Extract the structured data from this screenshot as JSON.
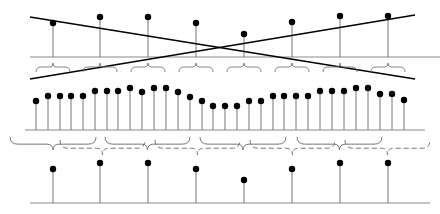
{
  "diagram": {
    "title": "",
    "colors": {
      "stroke": "#000000",
      "stem": "#777777",
      "baseline": "#888888",
      "brace": "#777777",
      "dot": "#000000",
      "background": "#ffffff"
    },
    "top_row": {
      "baseline_y": 57,
      "x_start": 30,
      "x_end": 440,
      "stems": [
        {
          "x": 53,
          "y": 23
        },
        {
          "x": 100,
          "y": 17
        },
        {
          "x": 148,
          "y": 17
        },
        {
          "x": 196,
          "y": 23
        },
        {
          "x": 244,
          "y": 34
        },
        {
          "x": 292,
          "y": 22
        },
        {
          "x": 340,
          "y": 16
        },
        {
          "x": 388,
          "y": 16
        }
      ],
      "lines": [
        {
          "x1": 30,
          "y1": 17,
          "x2": 415,
          "y2": 79
        },
        {
          "x1": 30,
          "y1": 79,
          "x2": 415,
          "y2": 15
        }
      ],
      "braces": [
        {
          "cx": 53,
          "y": 67,
          "w": 34
        },
        {
          "cx": 100,
          "y": 67,
          "w": 34
        },
        {
          "cx": 148,
          "y": 67,
          "w": 34
        },
        {
          "cx": 196,
          "y": 67,
          "w": 34
        },
        {
          "cx": 244,
          "y": 67,
          "w": 34
        },
        {
          "cx": 292,
          "y": 67,
          "w": 34
        },
        {
          "cx": 340,
          "y": 67,
          "w": 34
        },
        {
          "cx": 388,
          "y": 67,
          "w": 34
        }
      ]
    },
    "middle_row": {
      "baseline_y": 130,
      "x_start": 25,
      "x_end": 425,
      "stems": [
        {
          "x": 36,
          "y": 101
        },
        {
          "x": 48,
          "y": 96
        },
        {
          "x": 60,
          "y": 96
        },
        {
          "x": 71,
          "y": 96
        },
        {
          "x": 83,
          "y": 96
        },
        {
          "x": 95,
          "y": 91
        },
        {
          "x": 107,
          "y": 91
        },
        {
          "x": 118,
          "y": 91
        },
        {
          "x": 130,
          "y": 88
        },
        {
          "x": 142,
          "y": 92
        },
        {
          "x": 154,
          "y": 88
        },
        {
          "x": 166,
          "y": 88
        },
        {
          "x": 178,
          "y": 92
        },
        {
          "x": 190,
          "y": 97
        },
        {
          "x": 202,
          "y": 101
        },
        {
          "x": 213,
          "y": 106
        },
        {
          "x": 225,
          "y": 106
        },
        {
          "x": 237,
          "y": 106
        },
        {
          "x": 249,
          "y": 101
        },
        {
          "x": 261,
          "y": 101
        },
        {
          "x": 273,
          "y": 96
        },
        {
          "x": 284,
          "y": 96
        },
        {
          "x": 296,
          "y": 96
        },
        {
          "x": 308,
          "y": 96
        },
        {
          "x": 320,
          "y": 91
        },
        {
          "x": 332,
          "y": 91
        },
        {
          "x": 344,
          "y": 91
        },
        {
          "x": 356,
          "y": 88
        },
        {
          "x": 368,
          "y": 88
        },
        {
          "x": 380,
          "y": 94
        },
        {
          "x": 392,
          "y": 94
        },
        {
          "x": 404,
          "y": 100
        }
      ]
    },
    "bottom_row": {
      "baseline_y": 203,
      "x_start": 30,
      "x_end": 430,
      "stems": [
        {
          "x": 53,
          "y": 169
        },
        {
          "x": 100,
          "y": 163
        },
        {
          "x": 148,
          "y": 163
        },
        {
          "x": 196,
          "y": 169
        },
        {
          "x": 244,
          "y": 180
        },
        {
          "x": 292,
          "y": 169
        },
        {
          "x": 340,
          "y": 163
        },
        {
          "x": 388,
          "y": 163
        }
      ],
      "solid_braces": [
        {
          "x1": 10,
          "x2": 96,
          "y": 137,
          "tip": 150
        },
        {
          "x1": 105,
          "x2": 190,
          "y": 137,
          "tip": 150
        },
        {
          "x1": 200,
          "x2": 286,
          "y": 137,
          "tip": 150
        },
        {
          "x1": 297,
          "x2": 382,
          "y": 137,
          "tip": 150
        }
      ],
      "dashed_braces": [
        {
          "x1": 60,
          "x2": 145,
          "y": 140,
          "tip": 155
        },
        {
          "x1": 155,
          "x2": 240,
          "y": 140,
          "tip": 155
        },
        {
          "x1": 250,
          "x2": 335,
          "y": 140,
          "tip": 155
        },
        {
          "x1": 345,
          "x2": 430,
          "y": 140,
          "tip": 155
        }
      ]
    }
  }
}
